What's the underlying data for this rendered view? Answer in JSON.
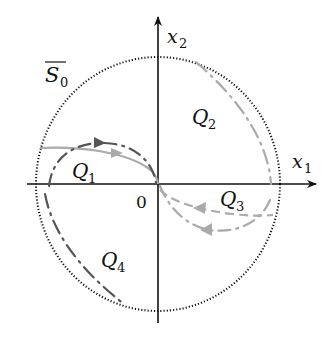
{
  "diagram": {
    "title": "",
    "axes": {
      "x_label": "x",
      "x_subscript": "1",
      "y_label": "x",
      "y_subscript": "2",
      "origin_label": "0"
    },
    "region": {
      "label": "S",
      "subscript": "0",
      "overline": true,
      "boundary_style": "dotted circle"
    },
    "quadrants": [
      {
        "label": "Q",
        "subscript": "1"
      },
      {
        "label": "Q",
        "subscript": "2"
      },
      {
        "label": "Q",
        "subscript": "3"
      },
      {
        "label": "Q",
        "subscript": "4"
      }
    ],
    "colors": {
      "axis": "#111111",
      "boundary": "#111111",
      "dark_trajectory": "#555555",
      "light_trajectory": "#aaaaaa"
    }
  }
}
